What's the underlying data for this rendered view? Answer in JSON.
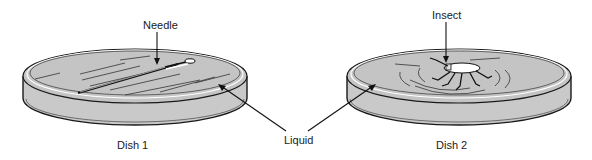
{
  "diagram": {
    "labels": {
      "needle": "Needle",
      "insect": "Insect",
      "liquid": "Liquid",
      "dish1": "Dish 1",
      "dish2": "Dish 2"
    },
    "colors": {
      "liquid": "#c4c4c4",
      "line": "#1a1a1a",
      "background": "#ffffff"
    }
  }
}
